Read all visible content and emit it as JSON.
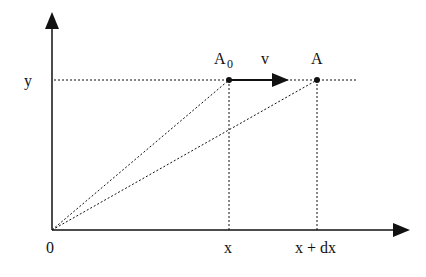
{
  "diagram": {
    "labels": {
      "y_axis": "y",
      "origin": "0",
      "x_tick": "x",
      "x_dx_tick": "x + dx",
      "point_a0_main": "A",
      "point_a0_sub": "0",
      "velocity": "v",
      "point_a": "A"
    },
    "colors": {
      "line": "#111111",
      "background": "#ffffff"
    }
  }
}
